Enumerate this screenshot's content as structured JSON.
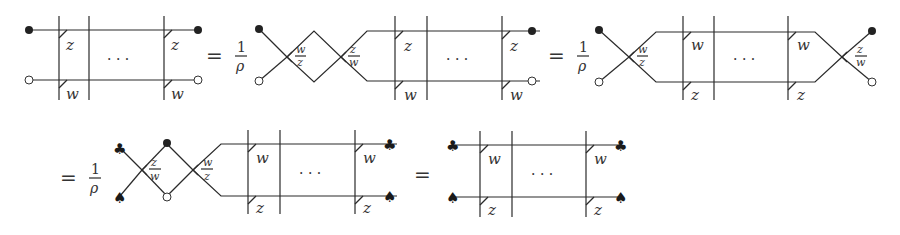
{
  "equation": {
    "row1": {
      "lhs": {
        "top_label": "z",
        "bottom_label": "w",
        "ellipsis": "· · ·",
        "left_endpoints": [
          "filled-dot",
          "open-dot"
        ],
        "right_endpoints": [
          "filled-dot",
          "open-dot"
        ]
      },
      "term2": {
        "equals": "=",
        "prefactor_num": "1",
        "prefactor_den": "ρ",
        "crossing1_num": "w",
        "crossing1_den": "z",
        "crossing2_num": "z",
        "crossing2_den": "w",
        "top_label": "z",
        "bottom_label": "w",
        "ellipsis": "· · ·"
      },
      "term3": {
        "equals": "=",
        "prefactor_num": "1",
        "prefactor_den": "ρ",
        "crossing_left_num": "w",
        "crossing_left_den": "z",
        "crossing_right_num": "z",
        "crossing_right_den": "w",
        "top_label": "w",
        "bottom_label": "z",
        "ellipsis": "· · ·"
      }
    },
    "row2": {
      "term4": {
        "equals": "=",
        "prefactor_num": "1",
        "prefactor_den": "ρ",
        "crossing1_num": "z",
        "crossing1_den": "w",
        "crossing2_num": "w",
        "crossing2_den": "z",
        "top_label": "w",
        "bottom_label": "z",
        "ellipsis": "· · ·",
        "left_endpoints": [
          "club",
          "spade"
        ],
        "middle_endpoints": [
          "filled-dot",
          "open-dot"
        ],
        "right_endpoints": [
          "club",
          "spade"
        ]
      },
      "term5": {
        "equals": "=",
        "top_label": "w",
        "bottom_label": "z",
        "ellipsis": "· · ·",
        "left_endpoints": [
          "club",
          "spade"
        ],
        "right_endpoints": [
          "club",
          "spade"
        ]
      }
    },
    "symbols": {
      "club": "♣",
      "spade": "♠"
    }
  }
}
